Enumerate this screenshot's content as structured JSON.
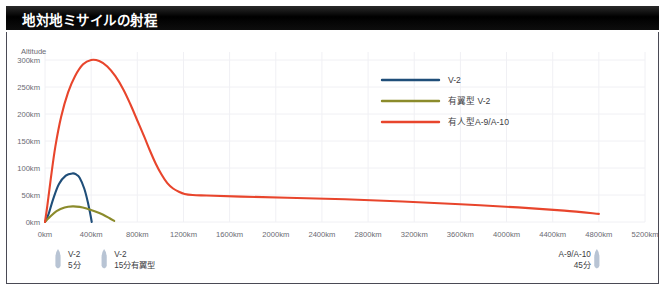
{
  "title": "地対地ミサイルの射程",
  "chart_data": {
    "type": "line",
    "title": "地対地ミサイルの射程",
    "ylabel": "Altitude",
    "xlabel": "",
    "xlim": [
      0,
      5200
    ],
    "ylim": [
      0,
      300
    ],
    "grid": true,
    "legend_position": "top-right",
    "yticks": [
      "0km",
      "50km",
      "100km",
      "150km",
      "200km",
      "250km",
      "300km"
    ],
    "ytick_values": [
      0,
      50,
      100,
      150,
      200,
      250,
      300
    ],
    "xticks": [
      "0km",
      "400km",
      "800km",
      "1200km",
      "1600km",
      "2000km",
      "2400km",
      "2800km",
      "3200km",
      "3600km",
      "4000km",
      "4400km",
      "4800km",
      "5200km"
    ],
    "xtick_values": [
      0,
      400,
      800,
      1200,
      1600,
      2000,
      2400,
      2800,
      3200,
      3600,
      4000,
      4400,
      4800,
      5200
    ],
    "series": [
      {
        "name": "V-2",
        "color": "#1F4E79",
        "x": [
          0,
          30,
          70,
          120,
          180,
          240,
          270,
          300,
          340,
          370,
          395,
          405
        ],
        "y": [
          0,
          14,
          42,
          70,
          86,
          90,
          88,
          82,
          62,
          38,
          12,
          0
        ]
      },
      {
        "name": "有翼型 V-2",
        "color": "#8B8B2B",
        "x": [
          0,
          40,
          100,
          170,
          240,
          300,
          360,
          430,
          500,
          560,
          600
        ],
        "y": [
          0,
          9,
          20,
          27,
          29,
          28,
          25,
          20,
          14,
          7,
          2
        ]
      },
      {
        "name": "有人型A-9/A-10",
        "color": "#E8452C",
        "x": [
          0,
          20,
          50,
          90,
          140,
          200,
          260,
          330,
          400,
          470,
          540,
          610,
          680,
          740,
          800,
          860,
          910,
          960,
          1010,
          1060,
          1110,
          1160,
          1210,
          1280,
          1400,
          1700,
          2100,
          2600,
          3100,
          3600,
          4100,
          4500,
          4800
        ],
        "y": [
          0,
          30,
          80,
          140,
          195,
          240,
          270,
          292,
          300,
          298,
          288,
          270,
          245,
          218,
          188,
          158,
          132,
          108,
          88,
          72,
          62,
          56,
          52,
          50,
          49,
          47,
          45,
          42,
          38,
          33,
          27,
          21,
          15
        ]
      }
    ]
  },
  "legend": {
    "items": [
      {
        "label": "V-2",
        "color": "#1F4E79"
      },
      {
        "label": "有翼型 V-2",
        "color": "#8B8B2B"
      },
      {
        "label": "有人型A-9/A-10",
        "color": "#E8452C"
      }
    ]
  },
  "annotations": [
    {
      "line1": "V-2",
      "line2": "5分",
      "x_pos": 0
    },
    {
      "line1": "V-2",
      "line2": "15分有翼型",
      "x_pos": 400
    },
    {
      "line1": "A-9/A-10",
      "line2": "45分",
      "x_pos": 4800
    }
  ]
}
